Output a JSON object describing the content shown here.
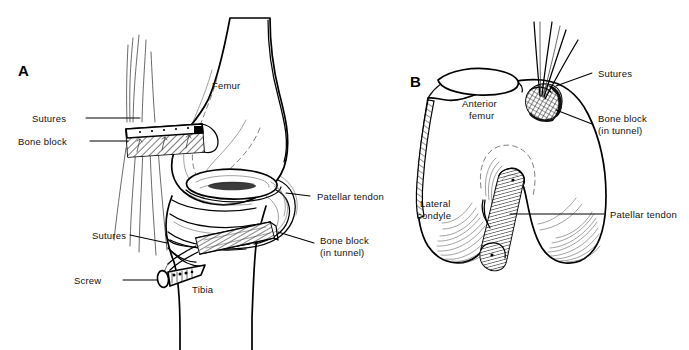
{
  "figure": {
    "background_color": "#ffffff",
    "ink_color": "#000000"
  },
  "panels": [
    {
      "id": "A",
      "letter": "A",
      "view": "lateral knee",
      "annotations": [
        {
          "name": "sutures-upper",
          "label": "Sutures",
          "line1": "Sutures",
          "line2": ""
        },
        {
          "name": "bone-block-upper",
          "label": "Bone block",
          "line1": "Bone block",
          "line2": ""
        },
        {
          "name": "femur",
          "label": "Femur",
          "line1": "Femur",
          "line2": ""
        },
        {
          "name": "patellar-tendon",
          "label": "Patellar tendon",
          "line1": "Patellar tendon",
          "line2": ""
        },
        {
          "name": "bone-block-tunnel",
          "label": "Bone block (in tunnel)",
          "line1": "Bone block",
          "line2": "(in tunnel)"
        },
        {
          "name": "sutures-lower",
          "label": "Sutures",
          "line1": "Sutures",
          "line2": ""
        },
        {
          "name": "screw",
          "label": "Screw",
          "line1": "Screw",
          "line2": ""
        },
        {
          "name": "tibia",
          "label": "Tibia",
          "line1": "Tibia",
          "line2": ""
        }
      ]
    },
    {
      "id": "B",
      "letter": "B",
      "view": "distal femur axial",
      "annotations": [
        {
          "name": "sutures",
          "label": "Sutures",
          "line1": "Sutures",
          "line2": ""
        },
        {
          "name": "bone-block-tunnel",
          "label": "Bone block (in tunnel)",
          "line1": "Bone block",
          "line2": "(in tunnel)"
        },
        {
          "name": "anterior-femur",
          "label": "Anterior femur",
          "line1": "Anterior",
          "line2": "femur"
        },
        {
          "name": "lateral-condyle",
          "label": "Lateral condyle",
          "line1": "Lateral",
          "line2": "condyle"
        },
        {
          "name": "patellar-tendon",
          "label": "Patellar tendon",
          "line1": "Patellar tendon",
          "line2": ""
        }
      ]
    }
  ]
}
